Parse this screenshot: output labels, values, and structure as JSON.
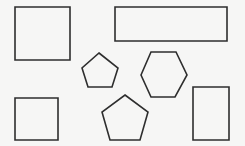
{
  "canvas": {
    "width": 245,
    "height": 146,
    "background": "#f6f6f5",
    "stroke_color": "#2e2e2e",
    "stroke_width": 1.6
  },
  "shapes": [
    {
      "name": "square-top-left",
      "type": "square",
      "points": "15,7 70,7 70,60 15,60"
    },
    {
      "name": "rectangle-wide-top-right",
      "type": "rectangle",
      "points": "115,7 227,7 227,41 115,41"
    },
    {
      "name": "pentagon-small-center",
      "type": "pentagon",
      "points": "99,53 118,68 112,87 88,87 82,68"
    },
    {
      "name": "hexagon-center-right",
      "type": "hexagon",
      "points": "141,75 151,52 176,52 187,75 175,97 151,97"
    },
    {
      "name": "pentagon-bottom-center",
      "type": "pentagon",
      "points": "125,95 148,112 140,140 110,140 102,112"
    },
    {
      "name": "square-bottom-left",
      "type": "square",
      "points": "15,98 58,98 58,140 15,140"
    },
    {
      "name": "rectangle-tall-bottom-right",
      "type": "rectangle",
      "points": "193,87 229,87 229,140 193,140"
    }
  ]
}
